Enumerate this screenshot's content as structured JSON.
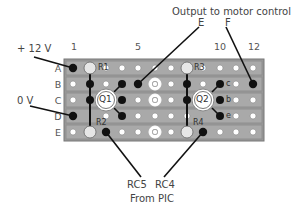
{
  "diagram": {
    "labels": {
      "supply": "+ 12 V",
      "ground": "0 V",
      "output": "Output to motor control",
      "out_e": "E",
      "out_f": "F",
      "rc5": "RC5",
      "rc4": "RC4",
      "from_pic": "From PIC"
    },
    "rows": [
      "A",
      "B",
      "C",
      "D",
      "E"
    ],
    "column_labels": [
      {
        "text": "1",
        "col": 1
      },
      {
        "text": "5",
        "col": 5
      },
      {
        "text": "10",
        "col": 10
      },
      {
        "text": "12",
        "col": 12
      }
    ],
    "components": {
      "r1": "R1",
      "r2": "R2",
      "r3": "R3",
      "r4": "R4",
      "q1": "Q1",
      "q2": "Q2",
      "pin_c": "c",
      "pin_b": "b",
      "pin_e": "e"
    },
    "colors": {
      "board": "#a8a8a8",
      "strip": "#8e8e8e",
      "hole": "#ffffff",
      "solder": "#111111",
      "wire": "#111111"
    }
  }
}
